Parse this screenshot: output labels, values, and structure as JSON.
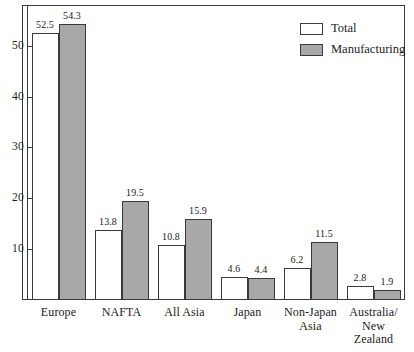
{
  "chart_data": {
    "type": "bar",
    "title": "",
    "subtitle": "",
    "xlabel": "",
    "ylabel": "",
    "ylim": [
      0,
      58
    ],
    "yticks": [
      10,
      20,
      30,
      40,
      50
    ],
    "grid": false,
    "legend_position": "top-right",
    "categories": [
      "Europe",
      "NAFTA",
      "All Asia",
      "Japan",
      "Non-Japan\nAsia",
      "Australia/\nNew\nZealand"
    ],
    "series": [
      {
        "name": "Total",
        "color": "#ffffff",
        "values": [
          52.5,
          13.8,
          10.8,
          4.6,
          6.2,
          2.8
        ],
        "labels": [
          "52.5",
          "13.8",
          "10.8",
          "4.6",
          "6.2",
          "2.8"
        ]
      },
      {
        "name": "Manufacturing",
        "color": "#a8a8a8",
        "values": [
          54.3,
          19.5,
          15.9,
          4.4,
          11.5,
          1.9
        ],
        "labels": [
          "54.3",
          "19.5",
          "15.9",
          "4.4",
          "11.5",
          "1.9"
        ]
      }
    ]
  },
  "legend": {
    "entries": [
      {
        "label": "Total",
        "swatch": "total"
      },
      {
        "label": "Manufacturing",
        "swatch": "manufacturing"
      }
    ]
  },
  "axis": {
    "tick_labels": [
      "50",
      "40",
      "30",
      "20",
      "10"
    ]
  }
}
